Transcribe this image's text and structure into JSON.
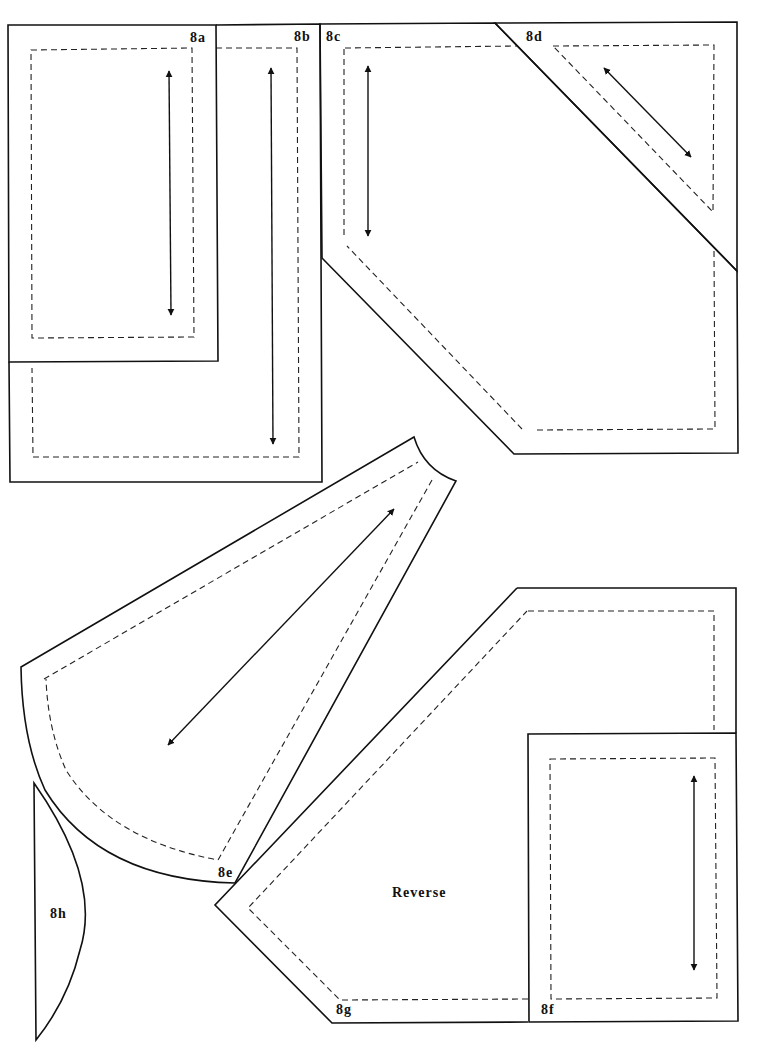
{
  "diagram": {
    "type": "quilt-pattern-templates",
    "pieces": [
      {
        "id": "8a",
        "label": "8a",
        "shape": "rectangle",
        "grainline": "vertical"
      },
      {
        "id": "8b",
        "label": "8b",
        "shape": "L-shape",
        "grainline": "vertical"
      },
      {
        "id": "8c",
        "label": "8c",
        "shape": "hexagon",
        "grainline": "vertical"
      },
      {
        "id": "8d",
        "label": "8d",
        "shape": "triangle",
        "grainline": "diagonal"
      },
      {
        "id": "8e",
        "label": "8e",
        "shape": "fan-wedge",
        "grainline": "diagonal"
      },
      {
        "id": "8f",
        "label": "8f",
        "shape": "rectangle",
        "grainline": "vertical"
      },
      {
        "id": "8g",
        "label": "8g",
        "shape": "pentagon",
        "grainline": "none",
        "note": "Reverse"
      },
      {
        "id": "8h",
        "label": "8h",
        "shape": "crescent",
        "grainline": "none"
      }
    ],
    "legend": {
      "solid_line": "cutting line",
      "dashed_line": "seam line",
      "double_arrow": "grainline"
    },
    "labels": {
      "a": "8a",
      "b": "8b",
      "c": "8c",
      "d": "8d",
      "e": "8e",
      "f": "8f",
      "g": "8g",
      "h": "8h",
      "reverse": "Reverse"
    }
  }
}
